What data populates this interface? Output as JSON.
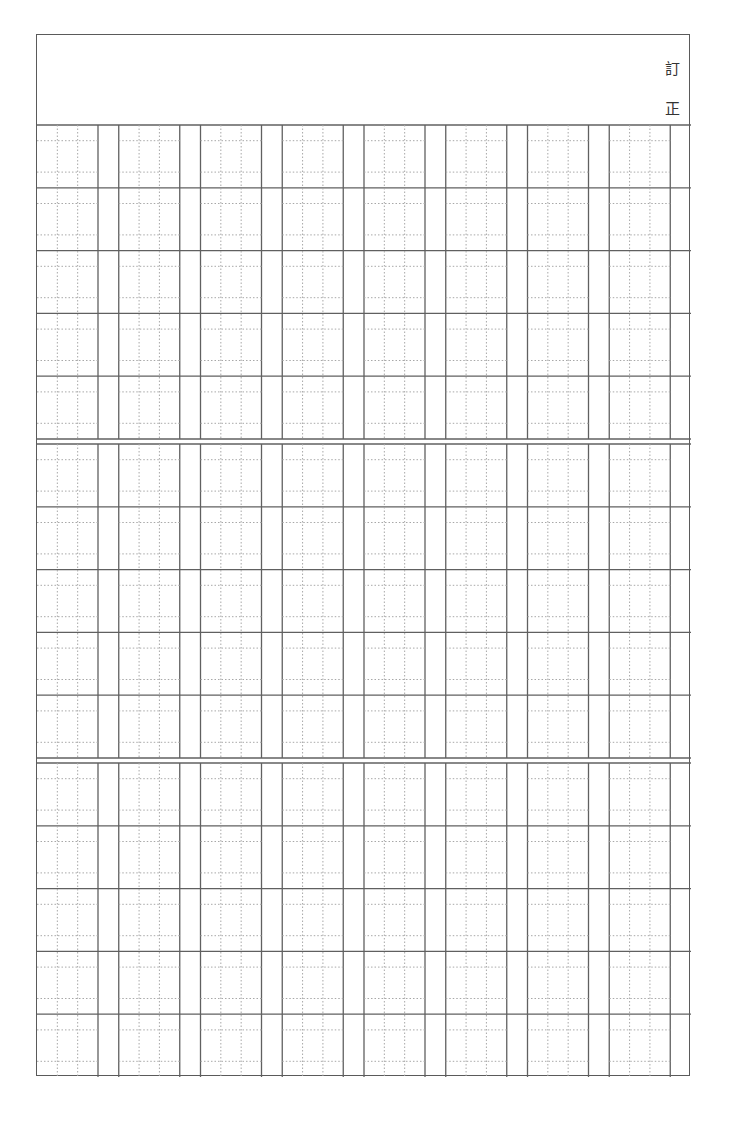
{
  "header": {
    "title_chars": [
      "訂",
      "正"
    ]
  },
  "worksheet": {
    "type": "kanji-practice-grid",
    "sections": 3,
    "rows_per_section": 5,
    "columns": 8,
    "cell_guides": "dotted-thirds",
    "line_color": "#606060",
    "guide_color": "#a8a8a8"
  }
}
